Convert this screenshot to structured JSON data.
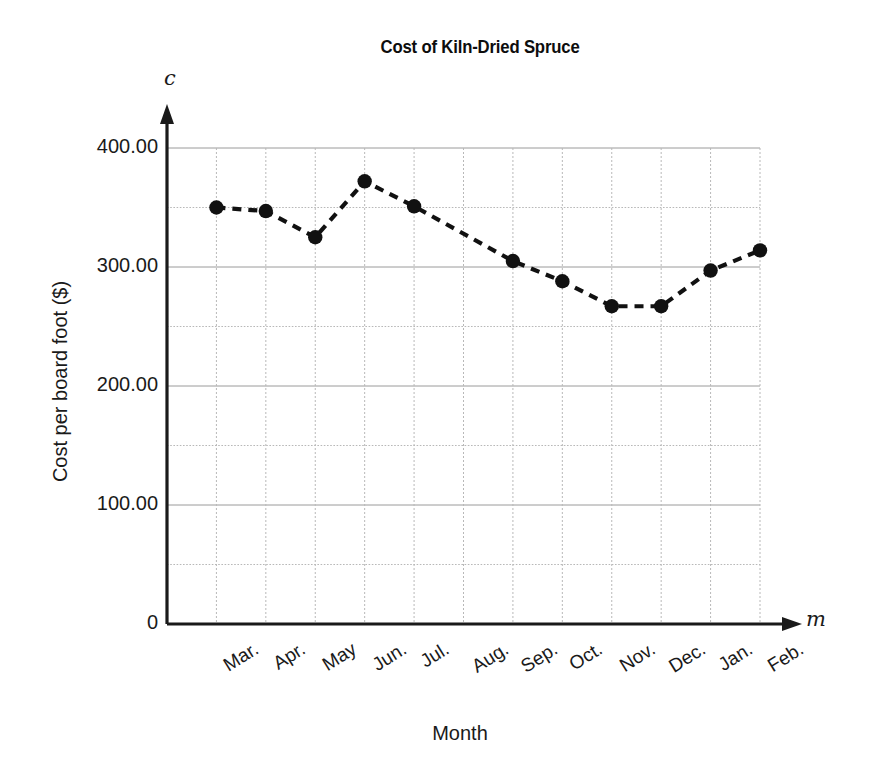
{
  "chart_data": {
    "type": "line",
    "title": "Cost of Kiln-Dried Spruce",
    "xlabel": "Month",
    "ylabel": "Cost per board foot ($)",
    "x_axis_variable": "m",
    "y_axis_variable": "c",
    "categories": [
      "Mar.",
      "Apr.",
      "May",
      "Jun.",
      "Jul.",
      "Aug.",
      "Sep.",
      "Oct.",
      "Nov.",
      "Dec.",
      "Jan.",
      "Feb."
    ],
    "values": [
      350.0,
      347.0,
      325.0,
      372.0,
      351.0,
      null,
      305.0,
      288.0,
      267.0,
      267.0,
      297.0,
      314.0
    ],
    "marker_visible": [
      true,
      true,
      true,
      true,
      true,
      false,
      true,
      true,
      true,
      true,
      true,
      true
    ],
    "ylim": [
      0,
      400
    ],
    "xlim": [
      0,
      12
    ],
    "y_tick_labels": [
      "0",
      "100.00",
      "200.00",
      "300.00",
      "400.00"
    ],
    "y_tick_values": [
      0,
      100,
      200,
      300,
      400
    ],
    "y_minor_tick_values": [
      50,
      150,
      250,
      350
    ],
    "grid": true,
    "grid_style": "dotted",
    "legend": false,
    "line_style": "dashed",
    "marker_style": "filled-circle",
    "series_color": "#111111",
    "grid_color": "#b8b8b8",
    "axis_color": "#1a1a1a"
  },
  "labels": {
    "title": "Cost of Kiln-Dried Spruce",
    "y_axis_title": "Cost per board foot ($)",
    "x_axis_title": "Month",
    "y_variable": "c",
    "x_variable": "m"
  }
}
